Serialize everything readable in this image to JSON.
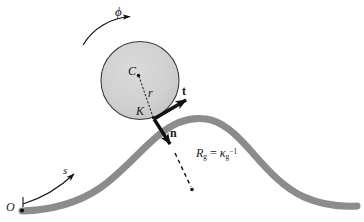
{
  "figure": {
    "background_color": "#ffffff",
    "curve_color": "#8c8c8c",
    "disc_fill_color": "#cfcfcf",
    "disc_stroke_color": "#333333",
    "vector_color": "#111111",
    "label_color": "#1a1a1a"
  },
  "labels": {
    "phi": "ϕ",
    "center_point": "C",
    "radius": "r",
    "contact_point": "K",
    "tangent_vector": "t",
    "normal_vector": "n",
    "radius_of_curvature_lhs": "R",
    "radius_of_curvature_lhs_sub": "g",
    "radius_of_curvature_eq": " = ",
    "radius_of_curvature_kappa": "κ",
    "radius_of_curvature_kappa_sub": "g",
    "radius_of_curvature_kappa_sup": "−1",
    "arclength": "s",
    "origin": "O"
  },
  "geometry": {
    "disc": {
      "cx": 140,
      "cy": 80.5,
      "r": 39
    },
    "center_dot": {
      "x": 137,
      "y": 75
    },
    "contact_dot": {
      "x": 153.5,
      "y": 118
    },
    "vector_origin": {
      "x": 154,
      "y": 119
    },
    "tangent_tip": {
      "x": 192,
      "y": 97
    },
    "normal_tip": {
      "x": 174,
      "y": 151
    },
    "dashed_end": {
      "x": 192,
      "y": 190
    },
    "origin_dot": {
      "x": 22,
      "y": 211
    },
    "curve_points": [
      [
        22,
        211
      ],
      [
        60,
        207
      ],
      [
        95,
        193
      ],
      [
        125,
        168
      ],
      [
        155,
        138
      ],
      [
        182,
        121
      ],
      [
        205,
        119
      ],
      [
        232,
        131
      ],
      [
        258,
        155
      ],
      [
        288,
        182
      ],
      [
        320,
        200
      ],
      [
        356,
        206
      ]
    ],
    "curve_width": 7
  }
}
